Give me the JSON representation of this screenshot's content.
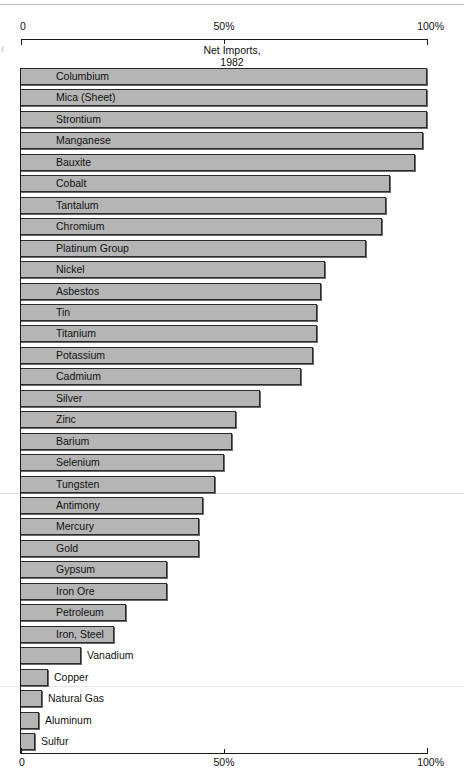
{
  "chart_data": {
    "type": "bar",
    "orientation": "horizontal",
    "title": "Net Imports,\n1982",
    "title_line1": "Net Imports,",
    "title_line2": "1982",
    "xlabel": "",
    "ylabel": "",
    "xlim": [
      0,
      100
    ],
    "unit": "%",
    "grid": false,
    "legend": null,
    "axis_top_ticks": [
      {
        "value": 0,
        "label": "0"
      },
      {
        "value": 50,
        "label": "50%"
      },
      {
        "value": 100,
        "label": "100%"
      }
    ],
    "axis_bottom_ticks": [
      {
        "value": 0,
        "label": "0"
      },
      {
        "value": 50,
        "label": "50%"
      },
      {
        "value": 100,
        "label": "100%"
      }
    ],
    "categories": [
      "Columbium",
      "Mica (Sheet)",
      "Strontium",
      "Manganese",
      "Bauxite",
      "Cobalt",
      "Tantalum",
      "Chromium",
      "Platinum Group",
      "Nickel",
      "Asbestos",
      "Tin",
      "Titanium",
      "Potassium",
      "Cadmium",
      "Silver",
      "Zinc",
      "Barium",
      "Selenium",
      "Tungsten",
      "Antimony",
      "Mercury",
      "Gold",
      "Gypsum",
      "Iron Ore",
      "Petroleum",
      "Iron, Steel",
      "Vanadium",
      "Copper",
      "Natural Gas",
      "Aluminum",
      "Sulfur"
    ],
    "values": [
      100,
      100,
      100,
      99,
      97,
      91,
      90,
      89,
      85,
      75,
      74,
      73,
      73,
      72,
      69,
      59,
      53,
      52,
      50,
      48,
      45,
      44,
      44,
      36,
      36,
      26,
      23,
      15,
      7,
      5.5,
      4.7,
      3.7
    ],
    "bars": [
      {
        "label": "Columbium",
        "value": 100,
        "label_placement": "inside"
      },
      {
        "label": "Mica (Sheet)",
        "value": 100,
        "label_placement": "inside"
      },
      {
        "label": "Strontium",
        "value": 100,
        "label_placement": "inside"
      },
      {
        "label": "Manganese",
        "value": 99,
        "label_placement": "inside"
      },
      {
        "label": "Bauxite",
        "value": 97,
        "label_placement": "inside"
      },
      {
        "label": "Cobalt",
        "value": 91,
        "label_placement": "inside"
      },
      {
        "label": "Tantalum",
        "value": 90,
        "label_placement": "inside"
      },
      {
        "label": "Chromium",
        "value": 89,
        "label_placement": "inside"
      },
      {
        "label": "Platinum Group",
        "value": 85,
        "label_placement": "inside"
      },
      {
        "label": "Nickel",
        "value": 75,
        "label_placement": "inside"
      },
      {
        "label": "Asbestos",
        "value": 74,
        "label_placement": "inside"
      },
      {
        "label": "Tin",
        "value": 73,
        "label_placement": "inside"
      },
      {
        "label": "Titanium",
        "value": 73,
        "label_placement": "inside"
      },
      {
        "label": "Potassium",
        "value": 72,
        "label_placement": "inside"
      },
      {
        "label": "Cadmium",
        "value": 69,
        "label_placement": "inside"
      },
      {
        "label": "Silver",
        "value": 59,
        "label_placement": "inside"
      },
      {
        "label": "Zinc",
        "value": 53,
        "label_placement": "inside"
      },
      {
        "label": "Barium",
        "value": 52,
        "label_placement": "inside"
      },
      {
        "label": "Selenium",
        "value": 50,
        "label_placement": "inside"
      },
      {
        "label": "Tungsten",
        "value": 48,
        "label_placement": "inside"
      },
      {
        "label": "Antimony",
        "value": 45,
        "label_placement": "inside"
      },
      {
        "label": "Mercury",
        "value": 44,
        "label_placement": "inside"
      },
      {
        "label": "Gold",
        "value": 44,
        "label_placement": "inside"
      },
      {
        "label": "Gypsum",
        "value": 36,
        "label_placement": "inside"
      },
      {
        "label": "Iron Ore",
        "value": 36,
        "label_placement": "inside"
      },
      {
        "label": "Petroleum",
        "value": 26,
        "label_placement": "inside"
      },
      {
        "label": "Iron, Steel",
        "value": 23,
        "label_placement": "inside"
      },
      {
        "label": "Vanadium",
        "value": 15,
        "label_placement": "outside"
      },
      {
        "label": "Copper",
        "value": 7,
        "label_placement": "outside"
      },
      {
        "label": "Natural Gas",
        "value": 5.5,
        "label_placement": "outside"
      },
      {
        "label": "Aluminum",
        "value": 4.7,
        "label_placement": "outside"
      },
      {
        "label": "Sulfur",
        "value": 3.7,
        "label_placement": "outside"
      }
    ],
    "colors": {
      "bar_fill": "#b5b5b5",
      "bar_stroke": "#2b2b2b",
      "bar_shadow": "#6a6a6a",
      "axis": "#1a1a1a",
      "text": "#111111",
      "background": "#ffffff"
    }
  }
}
